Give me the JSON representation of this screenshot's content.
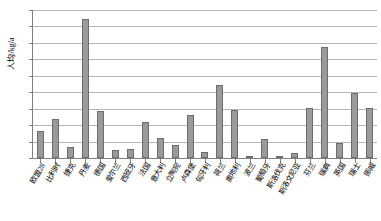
{
  "chart_data": {
    "type": "bar",
    "title": "",
    "subtitle": "",
    "xlabel": "",
    "ylabel": "人均/kg/a",
    "ylim": [
      0,
      900
    ],
    "ytick_step": 100,
    "yticks": [
      "900",
      "800",
      "700",
      "600",
      "500",
      "400",
      "300",
      "200",
      "100",
      "0"
    ],
    "grid": true,
    "legend": false,
    "legend_position": "none",
    "bar_color": "#9a9a9a",
    "bar_border_color": "#6d6d6d",
    "gridline_color": "#b5b5b5",
    "axis_color": "#808080",
    "categories": [
      "欧盟28",
      "比利时",
      "捷克",
      "丹麦",
      "德国",
      "爱尔兰",
      "西班牙",
      "法国",
      "意大利",
      "立陶宛",
      "卢森堡",
      "匈牙利",
      "荷兰",
      "奥地利",
      "波兰",
      "葡萄牙",
      "斯洛伐克",
      "斯洛文尼亚",
      "芬兰",
      "瑞典",
      "英国",
      "瑞士",
      "挪威"
    ],
    "values": [
      165,
      240,
      65,
      845,
      283,
      48,
      57,
      217,
      120,
      80,
      264,
      35,
      447,
      289,
      5,
      117,
      5,
      30,
      305,
      673,
      93,
      393,
      307
    ]
  }
}
